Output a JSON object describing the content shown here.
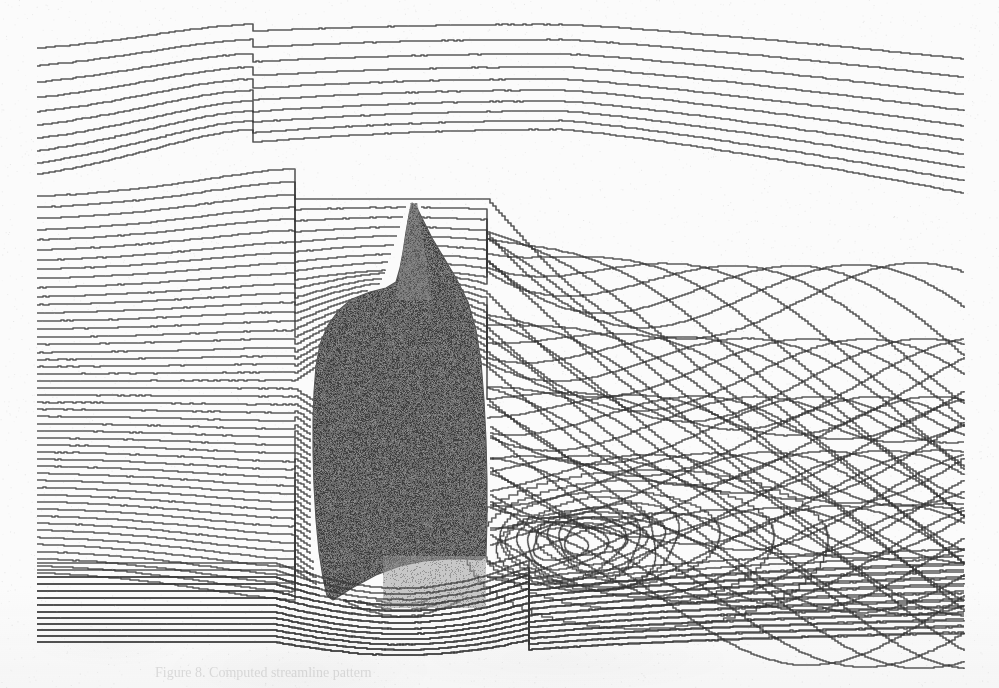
{
  "figure": {
    "kind": "streamline-flow-visualization",
    "caption_partial": "Figure 8.  Computed streamline pattern",
    "width_px": 999,
    "height_px": 688,
    "background_color": "#fbfbfb",
    "line_color": "#2b2b2b",
    "body_fill_color": "#6a6a6a",
    "body_edge_color": "#555555",
    "underbody_fill_color": "#9d9d9d",
    "spire_fill_color": "#8a8a8a",
    "line_width_px": 1.15,
    "scan_noise": true
  },
  "chart_data": {
    "type": "line",
    "subtitle": "Incompressible flow, left-to-right, with massive rear separation",
    "xlabel": "streamwise direction x",
    "ylabel": "vertical direction y",
    "xlim": [
      0,
      999
    ],
    "ylim": [
      0,
      688
    ],
    "grid": false,
    "legend_position": "none",
    "flow_direction": "left-to-right",
    "annotations": [
      "free-stream streamlines enter at left boundary",
      "streamlines deflect upward over the body shoulder",
      "thin tapering spire / mast above the body apex",
      "separation at the rear (trailing) face of the body",
      "large recirculating wake with crossing streamline bundles",
      "two counter-rotating vortex cores below the wake centre",
      "underbody gap flow accelerates beneath the body"
    ],
    "inlet": {
      "x_px": 37,
      "description": "Streamline seeding line at the left boundary. Spacing is wide at the top, compresses toward the middle-bottom.",
      "seed_y_px": [
        55,
        73,
        90,
        106,
        121,
        135,
        149,
        162,
        175,
        187,
        199,
        210,
        221,
        232,
        242,
        252,
        262,
        271,
        280,
        289,
        298,
        306,
        314,
        322,
        330,
        338,
        345,
        353,
        360,
        367,
        374,
        381,
        388,
        395,
        402,
        409,
        416,
        423,
        430,
        437,
        444,
        451,
        458,
        465,
        472,
        479,
        486,
        493,
        500,
        507,
        514,
        521,
        528,
        535,
        542,
        549,
        556,
        563,
        570,
        577,
        584,
        591,
        598,
        605,
        612,
        618,
        624,
        630,
        636,
        642
      ],
      "count": 70
    },
    "outlet": {
      "x_px": 965
    },
    "body": {
      "name": "bluff-body-silhouette",
      "apex_y_px": 203,
      "shoulder_y_px": 285,
      "base_y_px": 600,
      "left_x_px": 313,
      "right_x_px": 487,
      "max_width_px": 174,
      "outline_points": [
        [
          412,
          203
        ],
        [
          409,
          215
        ],
        [
          406,
          232
        ],
        [
          403,
          252
        ],
        [
          400,
          268
        ],
        [
          396,
          282
        ],
        [
          386,
          288
        ],
        [
          370,
          292
        ],
        [
          352,
          299
        ],
        [
          339,
          310
        ],
        [
          328,
          325
        ],
        [
          320,
          344
        ],
        [
          316,
          366
        ],
        [
          314,
          392
        ],
        [
          313,
          420
        ],
        [
          313,
          452
        ],
        [
          314,
          486
        ],
        [
          316,
          520
        ],
        [
          319,
          552
        ],
        [
          323,
          578
        ],
        [
          327,
          596
        ],
        [
          333,
          600
        ],
        [
          352,
          588
        ],
        [
          376,
          575
        ],
        [
          400,
          566
        ],
        [
          424,
          561
        ],
        [
          447,
          559
        ],
        [
          466,
          559
        ],
        [
          481,
          560
        ],
        [
          486,
          556
        ],
        [
          487,
          520
        ],
        [
          487,
          480
        ],
        [
          486,
          440
        ],
        [
          484,
          400
        ],
        [
          481,
          362
        ],
        [
          476,
          330
        ],
        [
          468,
          302
        ],
        [
          456,
          278
        ],
        [
          444,
          258
        ],
        [
          432,
          238
        ],
        [
          422,
          218
        ],
        [
          416,
          206
        ]
      ]
    },
    "spire": {
      "name": "mast-spire",
      "tip": [
        414,
        203
      ],
      "base_left": [
        395,
        300
      ],
      "base_right": [
        432,
        300
      ],
      "tip_width_px": 7,
      "base_width_px": 37
    },
    "underbody_patch": {
      "name": "underbody-wheel-block",
      "x_px": 383,
      "y_px": 556,
      "width_px": 103,
      "height_px": 52
    },
    "wake": {
      "separation_point": [
        488,
        392
      ],
      "vortex_cores": [
        [
          565,
          545
        ],
        [
          600,
          540
        ]
      ],
      "recirculation_extent_px": [
        488,
        720
      ],
      "crossing_bundle_x_range": [
        560,
        965
      ],
      "crossing_bundle_y_range": [
        240,
        470
      ],
      "upper_shear_layer_start": [
        490,
        300
      ],
      "lower_shear_layer_start": [
        492,
        560
      ]
    },
    "series_summary": {
      "name": "streamlines",
      "count": 70,
      "style": "solid thin black polylines",
      "notes": "Upper ~40 streamlines pass over the body and bulge upward, cresting near x=520-620; lower streamlines squeeze under the body and reattach downstream; mid streamlines enter the wake and cross repeatedly forming a diamond lattice."
    }
  }
}
